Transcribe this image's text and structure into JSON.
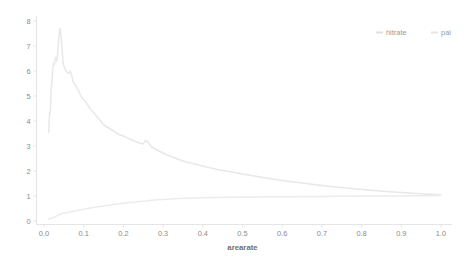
{
  "chart_data": {
    "type": "line",
    "title": "",
    "xlabel": "arearate",
    "ylabel": "",
    "xlim": [
      -0.035,
      1.06
    ],
    "ylim": [
      -0.12,
      8.35
    ],
    "grid": false,
    "legend_position": "top-right",
    "background_color": "#ffffff",
    "axis_color": "#e2e2e2",
    "tick_label_color": "#8a8a8a",
    "axis_title_color": "#6f6f6f",
    "xticks": [
      0.0,
      0.1,
      0.2,
      0.3,
      0.4,
      0.5,
      0.6,
      0.7,
      0.8,
      0.9,
      1.0
    ],
    "xtick_labels": [
      "0.0",
      "0.1",
      "0.2",
      "0.3",
      "0.4",
      "0.5",
      "0.6",
      "0.7",
      "0.8",
      "0.9",
      "1.0"
    ],
    "yticks": [
      0,
      1,
      2,
      3,
      4,
      5,
      6,
      7,
      8
    ],
    "ytick_labels": [
      "0",
      "1",
      "2",
      "3",
      "4",
      "5",
      "6",
      "7",
      "8"
    ],
    "series": [
      {
        "name": "hitrate",
        "color": "#e8e8e8",
        "x": [
          0.012,
          0.014,
          0.016,
          0.018,
          0.02,
          0.022,
          0.024,
          0.026,
          0.028,
          0.03,
          0.032,
          0.034,
          0.036,
          0.038,
          0.04,
          0.042,
          0.044,
          0.046,
          0.048,
          0.05,
          0.054,
          0.058,
          0.062,
          0.066,
          0.07,
          0.074,
          0.078,
          0.082,
          0.086,
          0.09,
          0.095,
          0.1,
          0.108,
          0.116,
          0.124,
          0.132,
          0.14,
          0.15,
          0.16,
          0.17,
          0.18,
          0.19,
          0.2,
          0.21,
          0.22,
          0.23,
          0.24,
          0.25,
          0.255,
          0.26,
          0.265,
          0.27,
          0.28,
          0.29,
          0.3,
          0.32,
          0.34,
          0.36,
          0.38,
          0.4,
          0.42,
          0.44,
          0.46,
          0.48,
          0.5,
          0.53,
          0.56,
          0.6,
          0.64,
          0.68,
          0.72,
          0.76,
          0.8,
          0.84,
          0.88,
          0.92,
          0.95,
          0.97,
          0.985,
          1.0
        ],
        "y": [
          3.55,
          4.35,
          4.3,
          5.3,
          5.55,
          6.05,
          6.3,
          6.25,
          6.45,
          6.55,
          6.4,
          6.6,
          7.1,
          7.45,
          7.7,
          7.55,
          7.2,
          6.75,
          6.35,
          6.2,
          6.05,
          5.95,
          5.9,
          6.0,
          5.8,
          5.55,
          5.45,
          5.35,
          5.25,
          5.1,
          4.95,
          4.85,
          4.7,
          4.5,
          4.35,
          4.2,
          4.05,
          3.85,
          3.75,
          3.65,
          3.55,
          3.45,
          3.4,
          3.32,
          3.25,
          3.18,
          3.12,
          3.08,
          3.22,
          3.18,
          3.1,
          2.98,
          2.88,
          2.8,
          2.72,
          2.58,
          2.46,
          2.35,
          2.28,
          2.2,
          2.12,
          2.05,
          2.0,
          1.94,
          1.88,
          1.8,
          1.72,
          1.62,
          1.54,
          1.46,
          1.38,
          1.32,
          1.26,
          1.21,
          1.16,
          1.12,
          1.09,
          1.07,
          1.06,
          1.04
        ]
      },
      {
        "name": "pai",
        "color": "#ececec",
        "x": [
          0.012,
          0.016,
          0.02,
          0.024,
          0.028,
          0.032,
          0.036,
          0.04,
          0.044,
          0.048,
          0.052,
          0.056,
          0.06,
          0.065,
          0.07,
          0.075,
          0.08,
          0.085,
          0.09,
          0.1,
          0.11,
          0.12,
          0.13,
          0.14,
          0.15,
          0.16,
          0.17,
          0.18,
          0.19,
          0.2,
          0.21,
          0.22,
          0.23,
          0.24,
          0.25,
          0.26,
          0.27,
          0.285,
          0.3,
          0.32,
          0.34,
          0.36,
          0.38,
          0.4,
          0.43,
          0.46,
          0.5,
          0.54,
          0.58,
          0.62,
          0.66,
          0.7,
          0.74,
          0.78,
          0.82,
          0.86,
          0.9,
          0.94,
          0.97,
          1.0
        ],
        "y": [
          0.08,
          0.1,
          0.12,
          0.14,
          0.17,
          0.2,
          0.24,
          0.27,
          0.29,
          0.31,
          0.32,
          0.33,
          0.34,
          0.36,
          0.38,
          0.39,
          0.41,
          0.42,
          0.44,
          0.47,
          0.5,
          0.53,
          0.56,
          0.58,
          0.6,
          0.63,
          0.65,
          0.67,
          0.69,
          0.71,
          0.73,
          0.75,
          0.76,
          0.78,
          0.79,
          0.8,
          0.83,
          0.85,
          0.86,
          0.88,
          0.9,
          0.91,
          0.92,
          0.93,
          0.94,
          0.95,
          0.96,
          0.965,
          0.97,
          0.975,
          0.98,
          0.985,
          0.99,
          0.995,
          1.0,
          1.0,
          1.005,
          1.01,
          1.01,
          1.02
        ]
      }
    ],
    "legend": [
      {
        "label": "hitrate",
        "color": "#e0e0e0"
      },
      {
        "label": "pai",
        "color": "#e4e4e4"
      }
    ]
  }
}
